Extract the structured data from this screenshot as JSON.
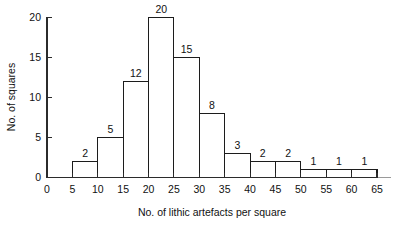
{
  "chart_data": {
    "type": "bar",
    "title": "",
    "subtitle": "",
    "xlabel": "No. of lithic artefacts per square",
    "ylabel": "No. of squares",
    "bin_width": 5,
    "bin_edges": [
      5,
      10,
      15,
      20,
      25,
      30,
      35,
      40,
      45,
      50,
      55,
      60,
      65
    ],
    "categories": [
      "5-10",
      "10-15",
      "15-20",
      "20-25",
      "25-30",
      "30-35",
      "35-40",
      "40-45",
      "45-50",
      "50-55",
      "55-60",
      "60-65"
    ],
    "values": [
      2,
      5,
      12,
      20,
      15,
      8,
      3,
      2,
      2,
      1,
      1,
      1
    ],
    "bars": [
      {
        "start": 5,
        "end": 10,
        "value": 2,
        "label": "2"
      },
      {
        "start": 10,
        "end": 15,
        "value": 5,
        "label": "5"
      },
      {
        "start": 15,
        "end": 20,
        "value": 12,
        "label": "12"
      },
      {
        "start": 20,
        "end": 25,
        "value": 20,
        "label": "20"
      },
      {
        "start": 25,
        "end": 30,
        "value": 15,
        "label": "15"
      },
      {
        "start": 30,
        "end": 35,
        "value": 8,
        "label": "8"
      },
      {
        "start": 35,
        "end": 40,
        "value": 3,
        "label": "3"
      },
      {
        "start": 40,
        "end": 45,
        "value": 2,
        "label": "2"
      },
      {
        "start": 45,
        "end": 50,
        "value": 2,
        "label": "2"
      },
      {
        "start": 50,
        "end": 55,
        "value": 1,
        "label": "1"
      },
      {
        "start": 55,
        "end": 60,
        "value": 1,
        "label": "1"
      },
      {
        "start": 60,
        "end": 65,
        "value": 1,
        "label": "1"
      }
    ],
    "xlim": [
      0,
      65
    ],
    "ylim": [
      0,
      20
    ],
    "x_ticks": [
      0,
      5,
      10,
      15,
      20,
      25,
      30,
      35,
      40,
      45,
      50,
      55,
      60,
      65
    ],
    "x_tick_labels": [
      "0",
      "5",
      "10",
      "15",
      "20",
      "25",
      "30",
      "35",
      "40",
      "45",
      "50",
      "55",
      "60",
      "65"
    ],
    "y_ticks": [
      0,
      5,
      10,
      15,
      20
    ],
    "y_tick_labels": [
      "0",
      "5",
      "10",
      "15",
      "20"
    ],
    "grid": false,
    "legend": false,
    "legend_position": "none",
    "colors": {
      "bar_fill": "#ffffff",
      "bar_stroke": "#1c1c1c",
      "axis": "#2b2b2b",
      "text": "#111111",
      "background": "#ffffff"
    }
  }
}
